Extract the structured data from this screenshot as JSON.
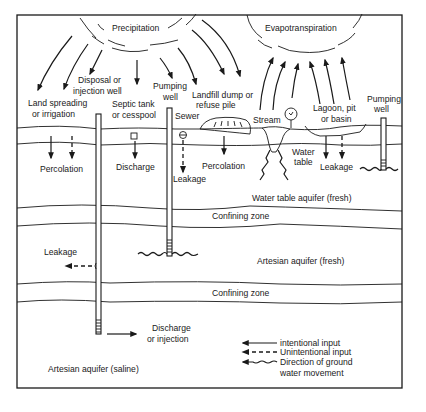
{
  "atmosphere": {
    "precipitation": "Precipitation",
    "evapotranspiration": "Evapotranspiration"
  },
  "sources": {
    "land_spreading": [
      "Land spreading",
      "or irrigation"
    ],
    "disposal_well": [
      "Disposal or",
      "injection well"
    ],
    "septic_tank": [
      "Septic tank",
      "or cesspool"
    ],
    "pumping_well_left": [
      "Pumping",
      "well"
    ],
    "sewer": "Sewer",
    "landfill": [
      "Landfill dump or",
      "refuse pile"
    ],
    "stream": "Stream",
    "lagoon": [
      "Lagoon, pit",
      "or basin"
    ],
    "pumping_well_right": [
      "Pumping",
      "well"
    ]
  },
  "processes": {
    "percolation_left": "Percolation",
    "discharge_septic": "Discharge",
    "leakage_sewer": "Leakage",
    "percolation_landfill": "Percolation",
    "water_table": [
      "Water",
      "table"
    ],
    "leakage_lagoon": "Leakage",
    "leakage_artesian": "Leakage",
    "discharge_injection": [
      "Discharge",
      "or injection"
    ]
  },
  "layers": {
    "water_table_aquifer": "Water table aquifer (fresh)",
    "confining_zone_1": "Confining zone",
    "artesian_fresh": "Artesian aquifer (fresh)",
    "confining_zone_2": "Confining zone",
    "artesian_saline": "Artesian aquifer (saline)"
  },
  "legend": {
    "intentional": "intentional input",
    "unintentional": "Unintentional input",
    "groundwater": [
      "Direction of ground",
      "water movement"
    ]
  }
}
